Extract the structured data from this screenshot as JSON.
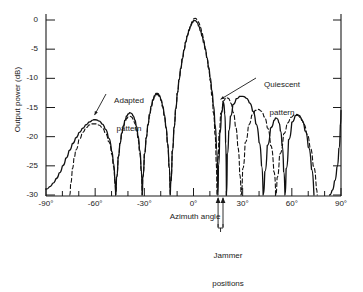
{
  "chart_data": {
    "type": "line",
    "title": "",
    "xlabel": "Azimuth angle",
    "ylabel": "Output power (dB)",
    "xlim": [
      -90,
      90
    ],
    "ylim": [
      -30,
      2
    ],
    "grid": false,
    "legend_position": "inline-annotations",
    "xticks": [
      "-90°",
      "-60°",
      "-30°",
      "0°",
      "30°",
      "60°",
      "90°"
    ],
    "xtick_values": [
      -90,
      -60,
      -30,
      0,
      30,
      60,
      90
    ],
    "xtick_minor_step": 10,
    "yticks": [
      "0",
      "-5",
      "-10",
      "-15",
      "-20",
      "-25",
      "-30"
    ],
    "ytick_values": [
      0,
      -5,
      -10,
      -15,
      -20,
      -25,
      -30
    ],
    "annotations": [
      {
        "name": "adapted-pattern-label",
        "text_line1": "Adapted",
        "text_line2": "pattern",
        "points_to_deg": -61,
        "points_to_db": -16.5
      },
      {
        "name": "quiescent-pattern-label",
        "text_line1": "Quiescent",
        "text_line2": "pattern",
        "points_to_deg": 16,
        "points_to_db": -13.5
      },
      {
        "name": "jammer-positions-label",
        "text_line1": "Jammer",
        "text_line2": "positions",
        "marks_deg": [
          15,
          18
        ]
      }
    ],
    "series": [
      {
        "name": "Adapted pattern",
        "style": "solid",
        "color": "#111111",
        "points": [
          [
            -90,
            -29.0
          ],
          [
            -88,
            -28.6
          ],
          [
            -86,
            -28.0
          ],
          [
            -84,
            -27.2
          ],
          [
            -82,
            -26.2
          ],
          [
            -80,
            -25.0
          ],
          [
            -78,
            -23.7
          ],
          [
            -76,
            -22.4
          ],
          [
            -74,
            -21.2
          ],
          [
            -72,
            -20.2
          ],
          [
            -70,
            -19.3
          ],
          [
            -68,
            -18.6
          ],
          [
            -66,
            -18.0
          ],
          [
            -64,
            -17.5
          ],
          [
            -62,
            -17.2
          ],
          [
            -61,
            -17.1
          ],
          [
            -60,
            -17.1
          ],
          [
            -58,
            -17.3
          ],
          [
            -56,
            -17.8
          ],
          [
            -54,
            -18.7
          ],
          [
            -52,
            -20.2
          ],
          [
            -50,
            -22.5
          ],
          [
            -49,
            -24.5
          ],
          [
            -48,
            -27.5
          ],
          [
            -47.5,
            -30
          ],
          [
            -47,
            -27.0
          ],
          [
            -46,
            -23.5
          ],
          [
            -45,
            -21.2
          ],
          [
            -44,
            -19.5
          ],
          [
            -43,
            -18.2
          ],
          [
            -42,
            -17.2
          ],
          [
            -41,
            -16.5
          ],
          [
            -40,
            -16.1
          ],
          [
            -39,
            -15.9
          ],
          [
            -38,
            -16.0
          ],
          [
            -37,
            -16.4
          ],
          [
            -36,
            -17.1
          ],
          [
            -35,
            -18.2
          ],
          [
            -34,
            -19.8
          ],
          [
            -33,
            -22.2
          ],
          [
            -32,
            -25.5
          ],
          [
            -31.3,
            -30
          ],
          [
            -31,
            -27.0
          ],
          [
            -30,
            -23.0
          ],
          [
            -29,
            -20.2
          ],
          [
            -28,
            -18.0
          ],
          [
            -27,
            -16.2
          ],
          [
            -26,
            -14.8
          ],
          [
            -25,
            -13.7
          ],
          [
            -24,
            -13.0
          ],
          [
            -23,
            -12.6
          ],
          [
            -22,
            -12.6
          ],
          [
            -21,
            -12.9
          ],
          [
            -20,
            -13.6
          ],
          [
            -19,
            -14.7
          ],
          [
            -18,
            -16.2
          ],
          [
            -17,
            -18.2
          ],
          [
            -16,
            -21.0
          ],
          [
            -15,
            -25.0
          ],
          [
            -14.2,
            -30
          ],
          [
            -14,
            -28.0
          ],
          [
            -13,
            -22.5
          ],
          [
            -12,
            -18.5
          ],
          [
            -11,
            -15.3
          ],
          [
            -10,
            -12.6
          ],
          [
            -9,
            -10.3
          ],
          [
            -8,
            -8.4
          ],
          [
            -7,
            -6.7
          ],
          [
            -6,
            -5.2
          ],
          [
            -5,
            -3.9
          ],
          [
            -4,
            -2.8
          ],
          [
            -3,
            -1.9
          ],
          [
            -2,
            -1.1
          ],
          [
            -1,
            -0.5
          ],
          [
            0,
            -0.1
          ],
          [
            1,
            -0.1
          ],
          [
            2,
            -0.4
          ],
          [
            3,
            -1.0
          ],
          [
            4,
            -1.8
          ],
          [
            5,
            -2.7
          ],
          [
            6,
            -3.8
          ],
          [
            7,
            -5.0
          ],
          [
            8,
            -6.4
          ],
          [
            9,
            -8.0
          ],
          [
            10,
            -9.8
          ],
          [
            11,
            -12.0
          ],
          [
            12,
            -14.6
          ],
          [
            13,
            -17.8
          ],
          [
            14,
            -22.0
          ],
          [
            14.9,
            -30
          ],
          [
            15.2,
            -25.0
          ],
          [
            16,
            -19.5
          ],
          [
            17,
            -16.0
          ],
          [
            18,
            -14.0
          ],
          [
            19,
            -16.0
          ],
          [
            19.6,
            -21.0
          ],
          [
            20.1,
            -30
          ],
          [
            20.6,
            -23.0
          ],
          [
            21.5,
            -19.0
          ],
          [
            22.5,
            -16.5
          ],
          [
            24,
            -14.5
          ],
          [
            26,
            -13.5
          ],
          [
            28,
            -13.1
          ],
          [
            30,
            -13.1
          ],
          [
            32,
            -13.4
          ],
          [
            34,
            -14.2
          ],
          [
            36,
            -15.6
          ],
          [
            38,
            -17.8
          ],
          [
            40,
            -21.0
          ],
          [
            41.5,
            -25.0
          ],
          [
            42.5,
            -30
          ],
          [
            43.5,
            -26.0
          ],
          [
            45,
            -21.5
          ],
          [
            47,
            -18.5
          ],
          [
            49,
            -17.2
          ],
          [
            50,
            -16.8
          ],
          [
            51,
            -16.9
          ],
          [
            52,
            -17.6
          ],
          [
            53,
            -19.0
          ],
          [
            54,
            -21.5
          ],
          [
            55,
            -26.0
          ],
          [
            55.8,
            -30
          ],
          [
            56.5,
            -25.5
          ],
          [
            58,
            -20.5
          ],
          [
            60,
            -17.5
          ],
          [
            62,
            -16.4
          ],
          [
            63,
            -16.2
          ],
          [
            64,
            -16.3
          ],
          [
            66,
            -17.2
          ],
          [
            68,
            -19.0
          ],
          [
            70,
            -21.8
          ],
          [
            72,
            -25.6
          ],
          [
            73.5,
            -30
          ]
        ]
      },
      {
        "name": "Quiescent pattern",
        "style": "dashed",
        "color": "#111111",
        "points": [
          [
            -75.5,
            -30
          ],
          [
            -75,
            -28.0
          ],
          [
            -74,
            -25.5
          ],
          [
            -73,
            -23.7
          ],
          [
            -72,
            -22.3
          ],
          [
            -70,
            -20.5
          ],
          [
            -68,
            -19.3
          ],
          [
            -66,
            -18.5
          ],
          [
            -64,
            -18.0
          ],
          [
            -62,
            -17.8
          ],
          [
            -60,
            -17.8
          ],
          [
            -58,
            -18.0
          ],
          [
            -56,
            -18.5
          ],
          [
            -54,
            -19.4
          ],
          [
            -52,
            -20.8
          ],
          [
            -50,
            -23.0
          ],
          [
            -49,
            -25.0
          ],
          [
            -48,
            -28.0
          ],
          [
            -47.5,
            -30
          ],
          [
            -47,
            -27.0
          ],
          [
            -46,
            -23.5
          ],
          [
            -45,
            -21.2
          ],
          [
            -44,
            -19.5
          ],
          [
            -43,
            -18.4
          ],
          [
            -42,
            -17.5
          ],
          [
            -41,
            -16.9
          ],
          [
            -40,
            -16.6
          ],
          [
            -39,
            -16.5
          ],
          [
            -38,
            -16.6
          ],
          [
            -37,
            -17.0
          ],
          [
            -36,
            -17.7
          ],
          [
            -35,
            -18.8
          ],
          [
            -34,
            -20.4
          ],
          [
            -33,
            -22.7
          ],
          [
            -32,
            -26.0
          ],
          [
            -31.3,
            -30
          ],
          [
            -31,
            -27.0
          ],
          [
            -30,
            -23.0
          ],
          [
            -29,
            -20.3
          ],
          [
            -28,
            -18.1
          ],
          [
            -27,
            -16.4
          ],
          [
            -26,
            -15.0
          ],
          [
            -25,
            -13.9
          ],
          [
            -24,
            -13.2
          ],
          [
            -23,
            -12.8
          ],
          [
            -22,
            -12.8
          ],
          [
            -21,
            -13.1
          ],
          [
            -20,
            -13.8
          ],
          [
            -19,
            -14.9
          ],
          [
            -18,
            -16.4
          ],
          [
            -17,
            -18.4
          ],
          [
            -16,
            -21.2
          ],
          [
            -15,
            -25.2
          ],
          [
            -14.2,
            -30
          ],
          [
            -14,
            -28.0
          ],
          [
            -13,
            -22.5
          ],
          [
            -12,
            -18.5
          ],
          [
            -11,
            -15.3
          ],
          [
            -10,
            -12.6
          ],
          [
            -9,
            -10.3
          ],
          [
            -8,
            -8.4
          ],
          [
            -7,
            -6.7
          ],
          [
            -6,
            -5.2
          ],
          [
            -5,
            -3.8
          ],
          [
            -4,
            -2.7
          ],
          [
            -3,
            -1.7
          ],
          [
            -2,
            -0.9
          ],
          [
            -1,
            -0.3
          ],
          [
            0,
            0.2
          ],
          [
            1,
            0.3
          ],
          [
            2,
            0.1
          ],
          [
            3,
            -0.4
          ],
          [
            4,
            -1.2
          ],
          [
            5,
            -2.2
          ],
          [
            6,
            -3.4
          ],
          [
            7,
            -4.8
          ],
          [
            8,
            -6.4
          ],
          [
            9,
            -8.2
          ],
          [
            10,
            -10.3
          ],
          [
            11,
            -12.8
          ],
          [
            12,
            -15.8
          ],
          [
            13,
            -19.5
          ],
          [
            13.8,
            -24.5
          ],
          [
            14.3,
            -30
          ],
          [
            14.8,
            -24.0
          ],
          [
            15.5,
            -19.5
          ],
          [
            16.5,
            -16.0
          ],
          [
            18,
            -13.9
          ],
          [
            19.5,
            -13.3
          ],
          [
            21,
            -13.4
          ],
          [
            22.5,
            -14.2
          ],
          [
            24,
            -15.8
          ],
          [
            25.5,
            -18.2
          ],
          [
            27,
            -21.8
          ],
          [
            28.2,
            -26.5
          ],
          [
            29,
            -30
          ],
          [
            30,
            -25.5
          ],
          [
            31.5,
            -21.0
          ],
          [
            33.5,
            -18.0
          ],
          [
            35.5,
            -16.3
          ],
          [
            37.5,
            -15.5
          ],
          [
            39,
            -15.3
          ],
          [
            41,
            -15.6
          ],
          [
            43,
            -16.6
          ],
          [
            45,
            -18.5
          ],
          [
            47,
            -21.5
          ],
          [
            49,
            -26.0
          ],
          [
            50.2,
            -30
          ],
          [
            51,
            -27.0
          ],
          [
            52.5,
            -23.0
          ],
          [
            55,
            -19.5
          ],
          [
            57,
            -17.7
          ],
          [
            59,
            -16.7
          ],
          [
            61,
            -16.3
          ],
          [
            63,
            -16.3
          ],
          [
            65,
            -16.8
          ],
          [
            67,
            -17.8
          ],
          [
            69,
            -19.5
          ],
          [
            71,
            -21.8
          ],
          [
            73,
            -25.0
          ],
          [
            75,
            -29.0
          ],
          [
            75.5,
            -30
          ]
        ]
      },
      {
        "name": "Corner rise near 90 degrees",
        "style": "solid",
        "color": "#111111",
        "points": [
          [
            83,
            -30
          ],
          [
            84.5,
            -29.2
          ],
          [
            86,
            -27.6
          ],
          [
            87.5,
            -25.2
          ],
          [
            88.7,
            -22.0
          ],
          [
            89.6,
            -18.0
          ],
          [
            90,
            -15.5
          ]
        ]
      }
    ]
  }
}
